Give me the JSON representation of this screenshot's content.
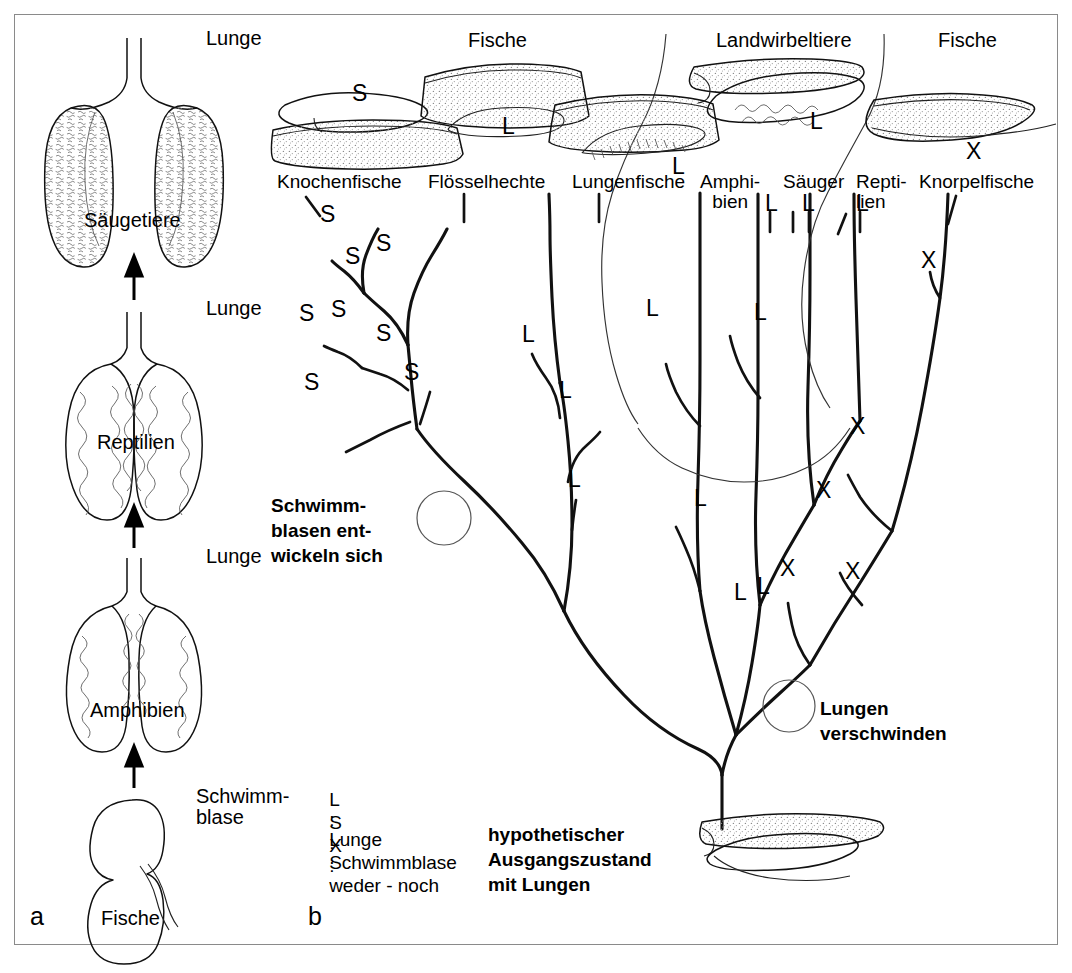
{
  "figure": {
    "panel_a": {
      "id": "a",
      "stages": [
        {
          "organ_label": "Lunge",
          "taxon": "Säugetiere"
        },
        {
          "organ_label": "Lunge",
          "taxon": "Reptilien"
        },
        {
          "organ_label": "Lunge",
          "taxon": "Amphibien"
        },
        {
          "organ_label": "Schwimm-\nblase",
          "taxon": "Fische"
        }
      ]
    },
    "panel_b": {
      "id": "b",
      "group_labels": [
        {
          "text": "Fische",
          "x": 497,
          "y": 42
        },
        {
          "text": "Landwirbeltiere",
          "x": 795,
          "y": 42
        },
        {
          "text": "Fische",
          "x": 975,
          "y": 42
        }
      ],
      "organ_markers": [
        {
          "text": "S",
          "x": 360,
          "y": 96
        },
        {
          "text": "L",
          "x": 508,
          "y": 128
        },
        {
          "text": "L",
          "x": 678,
          "y": 168
        },
        {
          "text": "L",
          "x": 816,
          "y": 120
        },
        {
          "text": "X",
          "x": 972,
          "y": 152
        }
      ],
      "taxa": [
        {
          "name": "Knochenfische",
          "x": 283,
          "y": 176
        },
        {
          "name": "Flösselhechte",
          "x": 433,
          "y": 176
        },
        {
          "name": "Lungenfische",
          "x": 578,
          "y": 176
        },
        {
          "name": "Amphi-\nbien",
          "x": 706,
          "y": 176
        },
        {
          "name": "Säuger",
          "x": 790,
          "y": 176
        },
        {
          "name": "Repti-\nlien",
          "x": 866,
          "y": 176
        },
        {
          "name": "Knorpelfische",
          "x": 925,
          "y": 176
        }
      ],
      "branch_markers": [
        {
          "text": "S",
          "x": 327,
          "y": 216
        },
        {
          "text": "S",
          "x": 383,
          "y": 245
        },
        {
          "text": "S",
          "x": 352,
          "y": 258
        },
        {
          "text": "S",
          "x": 306,
          "y": 315
        },
        {
          "text": "S",
          "x": 338,
          "y": 311
        },
        {
          "text": "S",
          "x": 383,
          "y": 335
        },
        {
          "text": "S",
          "x": 311,
          "y": 384
        },
        {
          "text": "S",
          "x": 411,
          "y": 374
        },
        {
          "text": "L",
          "x": 528,
          "y": 336
        },
        {
          "text": "L",
          "x": 565,
          "y": 392
        },
        {
          "text": "L",
          "x": 574,
          "y": 481
        },
        {
          "text": "L",
          "x": 652,
          "y": 310
        },
        {
          "text": "L",
          "x": 760,
          "y": 314
        },
        {
          "text": "L",
          "x": 770,
          "y": 200
        },
        {
          "text": "L",
          "x": 808,
          "y": 200
        },
        {
          "text": "L",
          "x": 862,
          "y": 200
        },
        {
          "text": "L",
          "x": 700,
          "y": 500
        },
        {
          "text": "L",
          "x": 740,
          "y": 594
        },
        {
          "text": "L",
          "x": 763,
          "y": 588
        },
        {
          "text": "X",
          "x": 928,
          "y": 262
        },
        {
          "text": "X",
          "x": 857,
          "y": 428
        },
        {
          "text": "X",
          "x": 823,
          "y": 492
        },
        {
          "text": "X",
          "x": 787,
          "y": 570
        },
        {
          "text": "X",
          "x": 852,
          "y": 573
        }
      ],
      "annotations": [
        {
          "text": "Schwimm-\nblasen ent-\nwickeln sich",
          "x": 277,
          "y": 496
        },
        {
          "text": "Lungen\nverschwinden",
          "x": 826,
          "y": 699
        },
        {
          "text": "hypothetischer\nAusgangszustand\nmit Lungen",
          "x": 494,
          "y": 826
        }
      ],
      "legend": [
        {
          "key": "L",
          "sep": ":",
          "value": "Lunge"
        },
        {
          "key": "S",
          "sep": ":",
          "value": "Schwimmblase"
        },
        {
          "key": "X",
          "sep": ":",
          "value": "weder - noch"
        }
      ]
    }
  },
  "colors": {
    "ink": "#111111",
    "frame": "#8a8a8a",
    "stipple": "#777777",
    "background": "#ffffff"
  }
}
